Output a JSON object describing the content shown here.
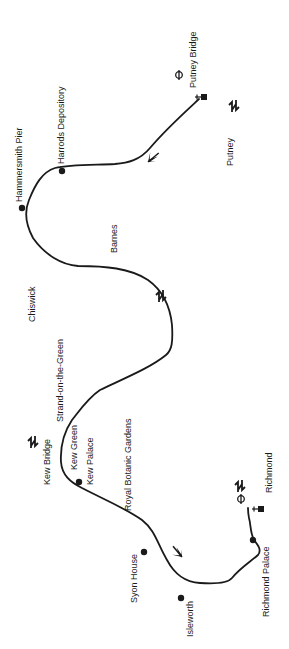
{
  "map": {
    "subject": "River Thames, Putney to Richmond",
    "colors": {
      "river": "#1a1a1a",
      "background": "#ffffff",
      "ink": "#1a1a1a"
    },
    "labels": {
      "putney_bridge": "Putney Bridge",
      "putney": "Putney",
      "harrods_depository": "Harrods Depository",
      "hammersmith_pier": "Hammersmith Pier",
      "barnes": "Barnes",
      "chiswick": "Chiswick",
      "strand_on_the_green": "Strand-on-the-Green",
      "kew_bridge": "Kew Bridge",
      "kew_green": "Kew Green",
      "kew_palace": "Kew Palace",
      "royal_botanic_gardens": "Royal Botanic Gardens",
      "syon_house": "Syon House",
      "isleworth": "Isleworth",
      "richmond_palace": "Richmond Palace",
      "richmond": "Richmond"
    },
    "symbols": [
      {
        "type": "underground-station-icon",
        "near": "Putney Bridge"
      },
      {
        "type": "pier-icon",
        "near": "Putney Bridge"
      },
      {
        "type": "rail-station-icon",
        "near": "Putney"
      },
      {
        "type": "rail-station-icon",
        "near": "Barnes"
      },
      {
        "type": "rail-station-icon",
        "near": "Kew Bridge"
      },
      {
        "type": "rail-station-icon",
        "near": "Richmond"
      },
      {
        "type": "underground-station-icon",
        "near": "Richmond"
      },
      {
        "type": "pier-icon",
        "near": "Richmond"
      }
    ],
    "direction_arrows": 2
  }
}
